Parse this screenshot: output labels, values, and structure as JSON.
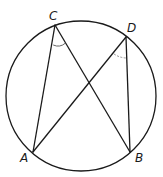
{
  "diagram": {
    "type": "inscribed-angles-circle",
    "circle": {
      "cx": 81,
      "cy": 96,
      "r": 75
    },
    "points": {
      "A": {
        "x": 33,
        "y": 152,
        "label": "A"
      },
      "B": {
        "x": 130,
        "y": 152,
        "label": "B"
      },
      "C": {
        "x": 55,
        "y": 25,
        "label": "C"
      },
      "D": {
        "x": 126,
        "y": 37,
        "label": "D"
      }
    },
    "segments": [
      "CA",
      "CB",
      "DA",
      "DB"
    ],
    "angle_marks": [
      "angle ACB",
      "angle ADB"
    ],
    "labels": {
      "A": "A",
      "B": "B",
      "C": "C",
      "D": "D"
    }
  }
}
